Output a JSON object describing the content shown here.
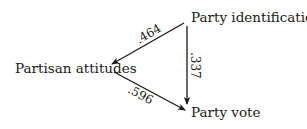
{
  "diagram": {
    "type": "path-diagram",
    "nodes": [
      {
        "id": "party_identification",
        "label": "Party identification"
      },
      {
        "id": "partisan_attitudes",
        "label": "Partisan attitudes"
      },
      {
        "id": "party_vote",
        "label": "Party vote"
      }
    ],
    "edges": [
      {
        "from": "party_identification",
        "to": "partisan_attitudes",
        "coefficient": ".464"
      },
      {
        "from": "party_identification",
        "to": "party_vote",
        "coefficient": ".337"
      },
      {
        "from": "partisan_attitudes",
        "to": "party_vote",
        "coefficient": ".596"
      }
    ],
    "colors": {
      "ink": "#1a1a1a",
      "background": "#ffffff"
    }
  }
}
